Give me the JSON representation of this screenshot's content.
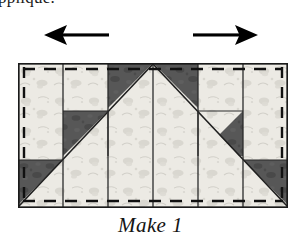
{
  "page": {
    "background_color": "#ffffff",
    "truncated_text_above": "ppliqué."
  },
  "arrows": {
    "left": {
      "name": "press-left-arrow",
      "direction": "left",
      "color": "#000000"
    },
    "right": {
      "name": "press-right-arrow",
      "direction": "right",
      "color": "#000000"
    }
  },
  "diagram": {
    "shape": "rectangle",
    "columns": 6,
    "colors": {
      "light_fabric": "#eceae4",
      "light_fabric_print": "#cfcdc6",
      "dark_fabric": "#5a5a5a",
      "dark_fabric_print": "#454545",
      "outline": "#1a1a1a",
      "seam_line": "#111111"
    },
    "elements": [
      {
        "name": "outer-border",
        "type": "rectangle-outline"
      },
      {
        "name": "center-large-triangle",
        "type": "triangle",
        "fabric": "light"
      },
      {
        "name": "dark-corner-top-left-of-center",
        "type": "triangle",
        "fabric": "dark"
      },
      {
        "name": "dark-corner-top-right-of-center",
        "type": "triangle",
        "fabric": "dark"
      },
      {
        "name": "dark-square-column2",
        "type": "half-square-triangle",
        "fabric": "dark"
      },
      {
        "name": "dark-square-column5",
        "type": "half-square-triangle",
        "fabric": "dark"
      },
      {
        "name": "dark-corner-bottom-left",
        "type": "triangle",
        "fabric": "dark"
      },
      {
        "name": "dark-corner-bottom-right",
        "type": "triangle",
        "fabric": "dark"
      },
      {
        "name": "dashed-seam-top",
        "type": "dashed-line"
      },
      {
        "name": "dashed-seam-bottom",
        "type": "dashed-line"
      },
      {
        "name": "dashed-seam-left",
        "type": "dashed-line"
      },
      {
        "name": "dashed-seam-right",
        "type": "dashed-line"
      },
      {
        "name": "column-divider-1",
        "type": "line"
      },
      {
        "name": "column-divider-2",
        "type": "line"
      },
      {
        "name": "column-divider-3",
        "type": "line"
      },
      {
        "name": "column-divider-4",
        "type": "line"
      },
      {
        "name": "column-divider-5",
        "type": "line"
      }
    ]
  },
  "caption": {
    "text": "Make 1"
  }
}
